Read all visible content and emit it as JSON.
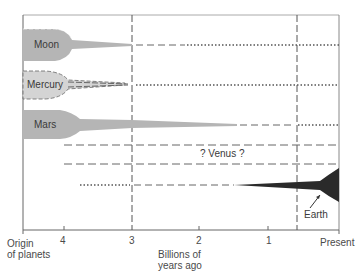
{
  "diagram": {
    "title": "",
    "axis": {
      "label_line1": "Billions of",
      "label_line2": "years ago",
      "origin_line1": "Origin",
      "origin_line2": "of planets",
      "ticks": [
        "4",
        "3",
        "2",
        "1"
      ],
      "present": "Present"
    },
    "planets": [
      {
        "name": "Moon",
        "activity_until_bya": 3.0,
        "style": "filled-then-dashed-then-dotted"
      },
      {
        "name": "Mercury",
        "activity_until_bya": 3.0,
        "style": "dashed-then-dotted"
      },
      {
        "name": "Mars",
        "activity_until_bya": 1.4,
        "style": "filled-then-dashed-then-dotted"
      },
      {
        "name": "? Venus ?",
        "activity_until_bya": null,
        "style": "dashed-uncertain"
      },
      {
        "name": "Earth",
        "activity_until_bya": 0,
        "style": "dotted-dashed-then-filled-growing"
      }
    ],
    "colors": {
      "fill_light": "#b5b5b5",
      "fill_lighter": "#d4d4d4",
      "fill_dark": "#2a2a2a",
      "line": "#555555"
    }
  }
}
